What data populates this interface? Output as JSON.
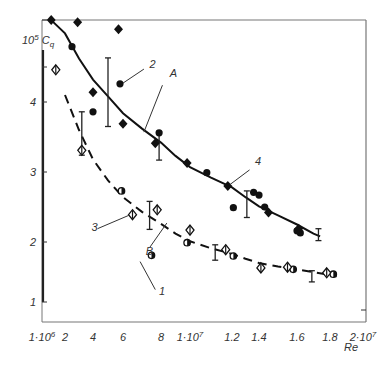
{
  "chart_data": {
    "type": "scatter",
    "title": "",
    "xlabel": "Re",
    "ylabel": "10^5 C_q",
    "ylabel_parts": {
      "prefix": "10",
      "exp": "5",
      "sym": "C",
      "sub": "q"
    },
    "x_ticks": [
      {
        "value": 1,
        "label": "1·10",
        "exp": "6"
      },
      {
        "value": 2,
        "label": "2"
      },
      {
        "value": 4,
        "label": "4"
      },
      {
        "value": 6,
        "label": "6"
      },
      {
        "value": 8,
        "label": "8"
      },
      {
        "value": 10,
        "label": "1·10",
        "exp": "7"
      },
      {
        "value": 12,
        "label": "1.2"
      },
      {
        "value": 14,
        "label": "1.4"
      },
      {
        "value": 16,
        "label": "1.6"
      },
      {
        "value": 18,
        "label": "1.8"
      },
      {
        "value": 20,
        "label": "2·10",
        "exp": "7"
      }
    ],
    "x_units": "Re in millions (10^6)",
    "y_ticks": [
      {
        "value": 1,
        "label": "1"
      },
      {
        "value": 2,
        "label": "2"
      },
      {
        "value": 3,
        "label": "3"
      },
      {
        "value": 4,
        "label": "4"
      }
    ],
    "ylim": [
      1,
      5.3
    ],
    "xlim": [
      1,
      20
    ],
    "grid": false,
    "legend": "none (numbered callouts)",
    "series": [
      {
        "name": "2",
        "marker": "filled-circle",
        "x": [
          2.5,
          5.8,
          4.0,
          7.9,
          10.8,
          12.1,
          13.6,
          14.0,
          14.3,
          16.0,
          16.2
        ],
        "y": [
          4.79,
          4.26,
          3.86,
          3.56,
          2.99,
          2.49,
          2.71,
          2.67,
          2.5,
          2.16,
          2.13
        ]
      },
      {
        "name": "4",
        "marker": "filled-diamond",
        "x": [
          1.4,
          2.9,
          5.7,
          4.0,
          6.0,
          7.7,
          9.8,
          11.8,
          14.5,
          16.1
        ],
        "y": [
          5.17,
          5.14,
          5.04,
          4.14,
          3.69,
          3.41,
          3.13,
          2.8,
          2.42,
          2.19
        ]
      },
      {
        "name": "1",
        "marker": "half-filled-circle",
        "x": [
          5.9,
          7.5,
          9.8,
          12.1,
          15.8,
          18.2
        ],
        "y": [
          2.73,
          1.81,
          1.99,
          1.8,
          1.61,
          1.54
        ]
      },
      {
        "name": "3",
        "marker": "open-diamond",
        "x": [
          1.6,
          3.2,
          6.5,
          7.8,
          10.0,
          11.7,
          14.1,
          15.5,
          17.8
        ],
        "y": [
          4.46,
          3.31,
          2.39,
          2.46,
          2.17,
          1.89,
          1.63,
          1.64,
          1.56
        ]
      }
    ],
    "curves": [
      {
        "name": "A",
        "style": "solid",
        "x": [
          1.4,
          2,
          3,
          4,
          5,
          6,
          7,
          8,
          9,
          10,
          11,
          12,
          13,
          14,
          15,
          16,
          17,
          17.4
        ],
        "y": [
          5.17,
          4.98,
          4.62,
          4.32,
          4.08,
          3.84,
          3.62,
          3.42,
          3.23,
          3.07,
          2.92,
          2.78,
          2.64,
          2.51,
          2.38,
          2.25,
          2.12,
          2.08
        ]
      },
      {
        "name": "B",
        "style": "dashed",
        "x": [
          2.0,
          3,
          4,
          5,
          6,
          7,
          8,
          9,
          10,
          11,
          12,
          13,
          14,
          15,
          16,
          17,
          18,
          18.4
        ],
        "y": [
          4.1,
          3.6,
          3.18,
          2.88,
          2.64,
          2.43,
          2.26,
          2.12,
          2.01,
          1.91,
          1.83,
          1.76,
          1.7,
          1.65,
          1.61,
          1.57,
          1.53,
          1.51
        ]
      }
    ],
    "error_bars": [
      {
        "x": 3.2,
        "low": 3.24,
        "high": 3.86
      },
      {
        "x": 5.0,
        "low": 3.65,
        "high": 4.63
      },
      {
        "x": 7.9,
        "low": 3.17,
        "high": 3.58
      },
      {
        "x": 7.4,
        "low": 2.18,
        "high": 2.58
      },
      {
        "x": 11.2,
        "low": 1.74,
        "high": 1.96
      },
      {
        "x": 13.1,
        "low": 2.35,
        "high": 2.73
      },
      {
        "x": 16.9,
        "low": 1.43,
        "high": 1.59
      },
      {
        "x": 17.3,
        "low": 2.02,
        "high": 2.19
      }
    ],
    "annotations": [
      {
        "text": "A",
        "x": 8.6,
        "y": 4.36
      },
      {
        "text": "B",
        "x": 7.2,
        "y": 1.82
      },
      {
        "text": "1",
        "x": 7.9,
        "y": 1.25
      },
      {
        "text": "2",
        "x": 7.4,
        "y": 4.49
      },
      {
        "text": "3",
        "x": 3.9,
        "y": 2.16
      },
      {
        "text": "4",
        "x": 13.7,
        "y": 3.1
      }
    ]
  }
}
